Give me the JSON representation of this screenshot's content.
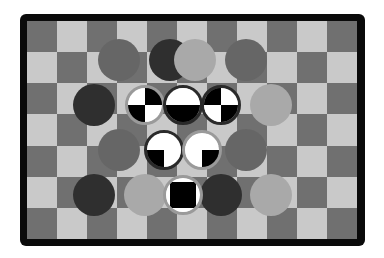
{
  "game": {
    "name": "checkerboard-piece-puzzle",
    "board": {
      "columns": 11,
      "rows": 7,
      "first_square": "dark",
      "colors": {
        "dark": "#707070",
        "light": "#c9c9c9",
        "frame": "#0a0a0a"
      }
    },
    "stone_colors": {
      "black": "#2f2f2f",
      "dark": "#666666",
      "light": "#a9a9a9"
    },
    "stones": [
      {
        "row": 1,
        "col": 3,
        "tone": "dark"
      },
      {
        "row": 1,
        "col": 5,
        "tone": "black"
      },
      {
        "row": 1,
        "col": 6,
        "tone": "light"
      },
      {
        "row": 1,
        "col": 8,
        "tone": "dark"
      },
      {
        "row": 2,
        "col": 2,
        "tone": "black"
      },
      {
        "row": 2,
        "col": 9,
        "tone": "light"
      },
      {
        "row": 3,
        "col": 3,
        "tone": "dark"
      },
      {
        "row": 3,
        "col": 8,
        "tone": "dark"
      },
      {
        "row": 4,
        "col": 2,
        "tone": "black"
      },
      {
        "row": 4,
        "col": 4,
        "tone": "light"
      },
      {
        "row": 4,
        "col": 7,
        "tone": "black"
      },
      {
        "row": 4,
        "col": 9,
        "tone": "light"
      }
    ],
    "special_pieces": [
      {
        "row": 2,
        "col": 4,
        "ring": "light",
        "quadrants": {
          "tl": "white",
          "tr": "black",
          "bl": "black",
          "br": "white"
        }
      },
      {
        "row": 2,
        "col": 5.5,
        "ring": "dark",
        "quadrants": {
          "tl": "white",
          "tr": "white",
          "bl": "black",
          "br": "black"
        }
      },
      {
        "row": 2,
        "col": 7,
        "ring": "dark",
        "quadrants": {
          "tl": "black",
          "tr": "white",
          "bl": "white",
          "br": "black"
        }
      },
      {
        "row": 3,
        "col": 4.75,
        "ring": "dark",
        "quadrants": {
          "tl": "white",
          "tr": "white",
          "bl": "black",
          "br": "white"
        }
      },
      {
        "row": 3,
        "col": 6.25,
        "ring": "light",
        "quadrants": {
          "tl": "white",
          "tr": "white",
          "bl": "white",
          "br": "black"
        }
      },
      {
        "row": 4,
        "col": 5.5,
        "ring": "light",
        "quadrants": {
          "tl": "white",
          "tr": "white",
          "bl": "white",
          "br": "white"
        },
        "inner": "black-square"
      }
    ]
  }
}
